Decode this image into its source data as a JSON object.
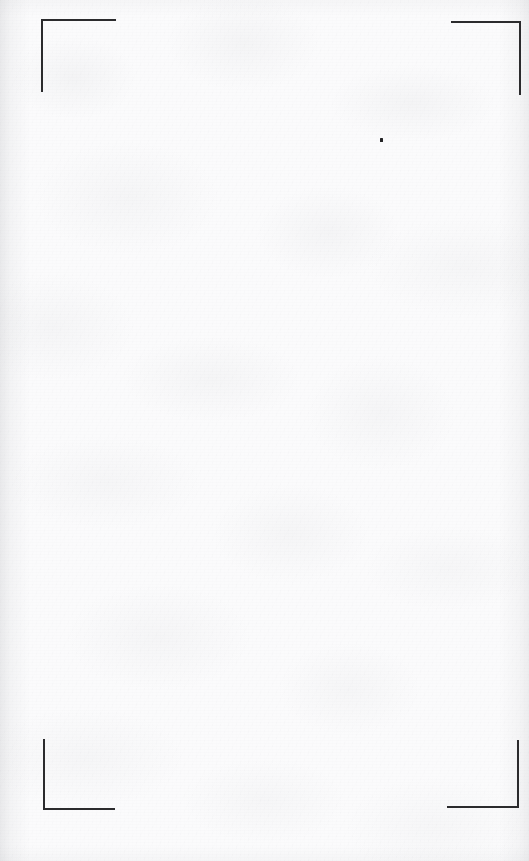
{
  "document": {
    "kind": "scanned-blank-page",
    "page_label": "",
    "body_text": "",
    "width_px": 529,
    "height_px": 861
  },
  "appearance": {
    "paper_color": "#fbfbfc",
    "mark_color": "#2b2b2d",
    "speck_color": "#232325",
    "texture": "faint gray mottling with scan grain",
    "edge_vignette": "subtle darker bands along left and right edges"
  },
  "crop_marks": [
    {
      "name": "top-left",
      "corner_x": 41,
      "corner_y": 19,
      "arm_h_length": 75,
      "arm_v_length": 73,
      "orientation": "right-down"
    },
    {
      "name": "top-right",
      "corner_x": 521,
      "corner_y": 21,
      "arm_h_length": 70,
      "arm_v_length": 74,
      "orientation": "left-down"
    },
    {
      "name": "bottom-left",
      "corner_x": 43,
      "corner_y": 810,
      "arm_h_length": 72,
      "arm_v_length": 71,
      "orientation": "right-up"
    },
    {
      "name": "bottom-right",
      "corner_x": 519,
      "corner_y": 808,
      "arm_h_length": 72,
      "arm_v_length": 68,
      "orientation": "left-up"
    }
  ],
  "artifacts": [
    {
      "name": "ink-speck",
      "x": 380,
      "y": 139,
      "width": 2.5,
      "height": 3.5
    }
  ]
}
